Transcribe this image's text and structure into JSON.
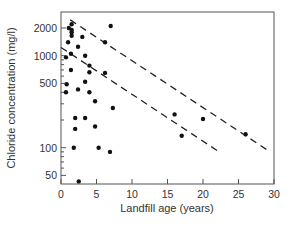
{
  "chart_data": {
    "type": "scatter",
    "title": "",
    "xlabel": "Landfill age (years)",
    "ylabel": "Chloride concentration (mg/l)",
    "xlim": [
      0,
      30
    ],
    "ylim": [
      41,
      2800
    ],
    "yscale": "log",
    "grid": false,
    "legend": null,
    "x_ticks": [
      0,
      5,
      10,
      15,
      20,
      25,
      30
    ],
    "y_ticks": [
      50,
      100,
      500,
      1000,
      2000
    ],
    "x_tick_labels": [
      "0",
      "5",
      "10",
      "15",
      "20",
      "25",
      "30"
    ],
    "y_tick_labels": [
      "50",
      "100",
      "500",
      "1000",
      "2000"
    ],
    "series": [
      {
        "name": "Landfill leachate samples",
        "marker": "filled-circle",
        "points": [
          [
            1.1,
            2000
          ],
          [
            1.5,
            2200
          ],
          [
            1.5,
            1900
          ],
          [
            1.5,
            1800
          ],
          [
            1.5,
            1650
          ],
          [
            1.0,
            1400
          ],
          [
            1.4,
            1050
          ],
          [
            0.7,
            960
          ],
          [
            2.4,
            1250
          ],
          [
            3.0,
            1600
          ],
          [
            7.0,
            2100
          ],
          [
            6.2,
            1400
          ],
          [
            3.4,
            1000
          ],
          [
            4.0,
            780
          ],
          [
            4.0,
            660
          ],
          [
            6.2,
            650
          ],
          [
            1.4,
            700
          ],
          [
            0.8,
            490
          ],
          [
            2.4,
            430
          ],
          [
            0.7,
            400
          ],
          [
            3.4,
            520
          ],
          [
            4.0,
            400
          ],
          [
            4.8,
            320
          ],
          [
            7.3,
            270
          ],
          [
            2.0,
            210
          ],
          [
            3.4,
            210
          ],
          [
            2.0,
            160
          ],
          [
            4.8,
            170
          ],
          [
            1.8,
            100
          ],
          [
            5.3,
            100
          ],
          [
            6.9,
            90
          ],
          [
            2.5,
            43
          ],
          [
            16.0,
            230
          ],
          [
            20.0,
            205
          ],
          [
            17.0,
            135
          ],
          [
            26.0,
            140
          ]
        ]
      }
    ],
    "lines": [
      {
        "name": "upper-envelope",
        "style": "dashed",
        "from": [
          1.3,
          2450
        ],
        "to": [
          29.0,
          95
        ]
      },
      {
        "name": "lower-envelope",
        "style": "dashed",
        "from": [
          0.0,
          1230
        ],
        "to": [
          22.0,
          93
        ]
      }
    ]
  }
}
